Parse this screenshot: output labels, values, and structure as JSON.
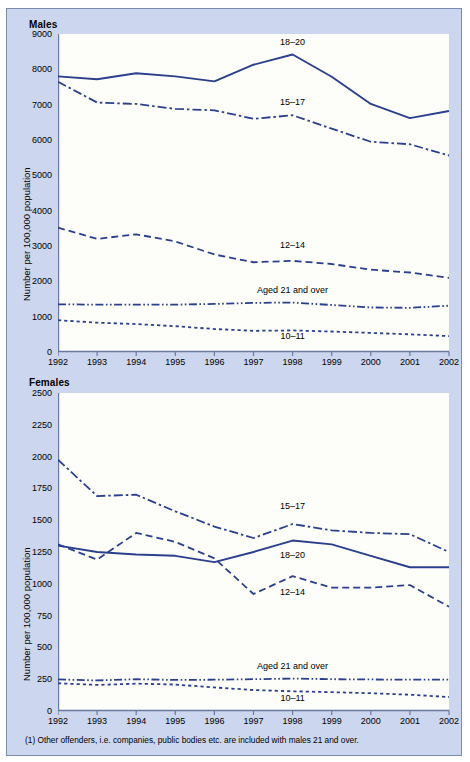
{
  "panel": {
    "region_note": "England and Wales",
    "footnote": "(1) Other offenders, i.e. companies, public bodies etc. are included with males 21 and over."
  },
  "charts": [
    {
      "id": "males",
      "title": "Males",
      "region": "England and Wales"
    },
    {
      "id": "females",
      "title": "Females",
      "region": ""
    }
  ],
  "chart_data": [
    {
      "type": "line",
      "title": "Males",
      "subtitle": "England and Wales",
      "xlabel": "",
      "ylabel": "Number per 100,000 population",
      "x": [
        1992,
        1993,
        1994,
        1995,
        1996,
        1997,
        1998,
        1999,
        2000,
        2001,
        2002
      ],
      "xticklabels": [
        "1992",
        "1993",
        "1994",
        "1995",
        "1996",
        "1997",
        "1998",
        "1999",
        "2000",
        "2001",
        "2002"
      ],
      "ylim": [
        0,
        9000
      ],
      "yticks": [
        0,
        1000,
        2000,
        3000,
        4000,
        5000,
        6000,
        7000,
        8000,
        9000
      ],
      "grid": false,
      "legend": "inline-annotations",
      "series": [
        {
          "name": "18–20",
          "style": "solid",
          "color": "#2b3f8c",
          "label_x": 1998,
          "label_y": 8750,
          "values": [
            7800,
            7720,
            7890,
            7800,
            7660,
            8130,
            8420,
            7790,
            7020,
            6620,
            6820
          ]
        },
        {
          "name": "15–17",
          "style": "dashdot",
          "color": "#2b3f8c",
          "label_x": 1998,
          "label_y": 7050,
          "values": [
            7650,
            7060,
            7020,
            6880,
            6840,
            6600,
            6700,
            6320,
            5950,
            5880,
            5560
          ]
        },
        {
          "name": "12–14",
          "style": "dashed",
          "color": "#2b3f8c",
          "label_x": 1998,
          "label_y": 3000,
          "values": [
            3520,
            3200,
            3330,
            3130,
            2760,
            2540,
            2580,
            2490,
            2330,
            2250,
            2100
          ]
        },
        {
          "name": "Aged 21 and over",
          "style": "dashdotdot",
          "color": "#2b3f8c",
          "label_x": 1998,
          "label_y": 1740,
          "values": [
            1350,
            1340,
            1340,
            1340,
            1360,
            1390,
            1400,
            1330,
            1260,
            1250,
            1310
          ]
        },
        {
          "name": "10–11",
          "style": "dotted",
          "color": "#2b3f8c",
          "label_x": 1998,
          "label_y": 420,
          "values": [
            900,
            830,
            790,
            730,
            650,
            600,
            610,
            580,
            540,
            500,
            450
          ]
        }
      ]
    },
    {
      "type": "line",
      "title": "Females",
      "subtitle": "",
      "xlabel": "",
      "ylabel": "Number per 100,000 population",
      "x": [
        1992,
        1993,
        1994,
        1995,
        1996,
        1997,
        1998,
        1999,
        2000,
        2001,
        2002
      ],
      "xticklabels": [
        "1992",
        "1993",
        "1994",
        "1995",
        "1996",
        "1997",
        "1998",
        "1999",
        "2000",
        "2001",
        "2002"
      ],
      "ylim": [
        0,
        2500
      ],
      "yticks": [
        0,
        250,
        500,
        750,
        1000,
        1250,
        1500,
        1750,
        2000,
        2250,
        2500
      ],
      "grid": false,
      "legend": "inline-annotations",
      "series": [
        {
          "name": "15–17",
          "style": "dashdot",
          "color": "#2b3f8c",
          "label_x": 1998,
          "label_y": 1600,
          "values": [
            1975,
            1690,
            1700,
            1570,
            1450,
            1360,
            1470,
            1420,
            1400,
            1390,
            1250
          ]
        },
        {
          "name": "18–20",
          "style": "solid",
          "color": "#2b3f8c",
          "label_x": 1998,
          "label_y": 1220,
          "values": [
            1300,
            1250,
            1230,
            1220,
            1170,
            1250,
            1340,
            1310,
            1220,
            1130,
            1130
          ]
        },
        {
          "name": "12–14",
          "style": "dashed",
          "color": "#2b3f8c",
          "label_x": 1998,
          "label_y": 930,
          "values": [
            1310,
            1190,
            1400,
            1330,
            1200,
            920,
            1060,
            970,
            970,
            990,
            820
          ]
        },
        {
          "name": "Aged 21 and over",
          "style": "dashdotdot",
          "color": "#2b3f8c",
          "label_x": 1998,
          "label_y": 345,
          "values": [
            248,
            240,
            250,
            244,
            246,
            250,
            255,
            250,
            248,
            246,
            247
          ]
        },
        {
          "name": "10–11",
          "style": "dotted",
          "color": "#2b3f8c",
          "label_x": 1998,
          "label_y": 95,
          "values": [
            218,
            205,
            215,
            208,
            185,
            165,
            155,
            148,
            140,
            128,
            110
          ]
        }
      ]
    }
  ]
}
